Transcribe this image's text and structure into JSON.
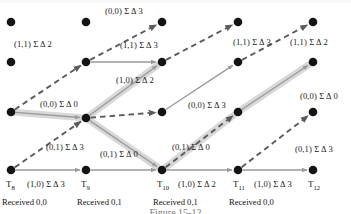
{
  "figure": {
    "type": "trellis-diagram",
    "caption": "Figure 15-12",
    "columns": [
      {
        "id": "T8",
        "label": "T",
        "sub": "8",
        "x": 11,
        "received": "Received 0,0"
      },
      {
        "id": "T9",
        "label": "T",
        "sub": "9",
        "x": 86,
        "received": "Received 0,1"
      },
      {
        "id": "T10",
        "label": "T",
        "sub": "10",
        "x": 162,
        "received": "Received 0,1"
      },
      {
        "id": "T11",
        "label": "T",
        "sub": "11",
        "x": 238,
        "received": "Received 0,0"
      },
      {
        "id": "T12",
        "label": "T",
        "sub": "12",
        "x": 313,
        "received": ""
      }
    ],
    "rows_y": [
      22,
      62,
      112,
      170
    ],
    "nodes": [
      {
        "col": 0,
        "row": 0,
        "x": 11,
        "y": 22
      },
      {
        "col": 0,
        "row": 1,
        "x": 11,
        "y": 62
      },
      {
        "col": 0,
        "row": 2,
        "x": 11,
        "y": 112
      },
      {
        "col": 0,
        "row": 3,
        "x": 11,
        "y": 170
      },
      {
        "col": 1,
        "row": 0,
        "x": 86,
        "y": 22
      },
      {
        "col": 1,
        "row": 1,
        "x": 86,
        "y": 62
      },
      {
        "col": 1,
        "row": 2,
        "x": 86,
        "y": 118
      },
      {
        "col": 1,
        "row": 3,
        "x": 86,
        "y": 170
      },
      {
        "col": 2,
        "row": 0,
        "x": 162,
        "y": 22
      },
      {
        "col": 2,
        "row": 1,
        "x": 162,
        "y": 62
      },
      {
        "col": 2,
        "row": 2,
        "x": 162,
        "y": 112
      },
      {
        "col": 2,
        "row": 3,
        "x": 162,
        "y": 170
      },
      {
        "col": 3,
        "row": 0,
        "x": 238,
        "y": 22
      },
      {
        "col": 3,
        "row": 1,
        "x": 238,
        "y": 62
      },
      {
        "col": 3,
        "row": 2,
        "x": 238,
        "y": 112
      },
      {
        "col": 3,
        "row": 3,
        "x": 238,
        "y": 170
      },
      {
        "col": 4,
        "row": 0,
        "x": 313,
        "y": 22
      },
      {
        "col": 4,
        "row": 1,
        "x": 313,
        "y": 62
      },
      {
        "col": 4,
        "row": 2,
        "x": 313,
        "y": 112
      },
      {
        "col": 4,
        "row": 3,
        "x": 313,
        "y": 170
      }
    ],
    "edges": [
      {
        "id": "e1",
        "from": [
          11,
          112
        ],
        "to": [
          86,
          62
        ],
        "style": "dashed",
        "highlight": false
      },
      {
        "id": "e2",
        "from": [
          11,
          112
        ],
        "to": [
          86,
          118
        ],
        "style": "solid",
        "highlight": true
      },
      {
        "id": "e3",
        "from": [
          11,
          170
        ],
        "to": [
          86,
          118
        ],
        "style": "dashed",
        "highlight": false
      },
      {
        "id": "e4",
        "from": [
          11,
          170
        ],
        "to": [
          86,
          170
        ],
        "style": "solid",
        "highlight": false
      },
      {
        "id": "e5",
        "from": [
          86,
          62
        ],
        "to": [
          162,
          22
        ],
        "style": "dashed",
        "highlight": false
      },
      {
        "id": "e6",
        "from": [
          86,
          62
        ],
        "to": [
          162,
          62
        ],
        "style": "solid",
        "highlight": false
      },
      {
        "id": "e7",
        "from": [
          86,
          118
        ],
        "to": [
          162,
          62
        ],
        "style": "solid",
        "highlight": true
      },
      {
        "id": "e8",
        "from": [
          86,
          118
        ],
        "to": [
          162,
          112
        ],
        "style": "dashed",
        "highlight": false
      },
      {
        "id": "e9",
        "from": [
          86,
          118
        ],
        "to": [
          162,
          170
        ],
        "style": "solid",
        "highlight": true
      },
      {
        "id": "e10",
        "from": [
          86,
          170
        ],
        "to": [
          162,
          170
        ],
        "style": "solid",
        "highlight": false
      },
      {
        "id": "e11",
        "from": [
          162,
          62
        ],
        "to": [
          238,
          22
        ],
        "style": "dashed",
        "highlight": false
      },
      {
        "id": "e12",
        "from": [
          162,
          112
        ],
        "to": [
          238,
          62
        ],
        "style": "solid",
        "highlight": false
      },
      {
        "id": "e13",
        "from": [
          162,
          170
        ],
        "to": [
          238,
          112
        ],
        "style": "dashed",
        "highlight": true
      },
      {
        "id": "e14",
        "from": [
          162,
          170
        ],
        "to": [
          238,
          170
        ],
        "style": "solid",
        "highlight": false
      },
      {
        "id": "e15",
        "from": [
          238,
          62
        ],
        "to": [
          313,
          22
        ],
        "style": "dashed",
        "highlight": false
      },
      {
        "id": "e16",
        "from": [
          238,
          112
        ],
        "to": [
          313,
          62
        ],
        "style": "solid",
        "highlight": true
      },
      {
        "id": "e17",
        "from": [
          238,
          170
        ],
        "to": [
          313,
          112
        ],
        "style": "dashed",
        "highlight": false
      },
      {
        "id": "e18",
        "from": [
          238,
          170
        ],
        "to": [
          313,
          170
        ],
        "style": "solid",
        "highlight": false
      }
    ],
    "edge_labels": [
      {
        "id": "l1",
        "text": "(1,1) Σ Δ 2",
        "x": 14,
        "y": 40
      },
      {
        "id": "l2",
        "text": "(0,0) Σ Δ 0",
        "x": 40,
        "y": 100
      },
      {
        "id": "l3",
        "text": "(0,1) Σ Δ 3",
        "x": 46,
        "y": 143
      },
      {
        "id": "l4",
        "text": "(1,0) Σ Δ 3",
        "x": 27,
        "y": 180
      },
      {
        "id": "l5",
        "text": "(0,0) Σ Δ 3",
        "x": 105,
        "y": 7
      },
      {
        "id": "l6",
        "text": "(1,1) Σ Δ 3",
        "x": 120,
        "y": 41
      },
      {
        "id": "l7",
        "text": "(1,0) Σ Δ 2",
        "x": 116,
        "y": 76
      },
      {
        "id": "l8",
        "text": "(0,1) Σ Δ 0",
        "x": 100,
        "y": 150
      },
      {
        "id": "l9",
        "text": "(0,0) Σ Δ 3",
        "x": 188,
        "y": 101
      },
      {
        "id": "l10",
        "text": "(1,1) Σ Δ 3",
        "x": 233,
        "y": 38
      },
      {
        "id": "l11",
        "text": "(0,1) Σ Δ 0",
        "x": 172,
        "y": 143
      },
      {
        "id": "l12",
        "text": "(1,0) Σ Δ 2",
        "x": 178,
        "y": 180
      },
      {
        "id": "l13",
        "text": "(1,1) Σ Δ 2",
        "x": 290,
        "y": 38
      },
      {
        "id": "l14",
        "text": "(0,0) Σ Δ 0",
        "x": 300,
        "y": 92
      },
      {
        "id": "l15",
        "text": "(0,1) Σ Δ 3",
        "x": 295,
        "y": 145
      },
      {
        "id": "l16",
        "text": "(1,0) Σ Δ 3",
        "x": 254,
        "y": 180
      }
    ],
    "colors": {
      "node": "#141414",
      "dashed_edge": "#5b5b5b",
      "solid_edge": "#9a9a9a",
      "highlight": "#d8d8d8",
      "text": "#1a1a1a",
      "caption": "#8c8c8c"
    }
  }
}
